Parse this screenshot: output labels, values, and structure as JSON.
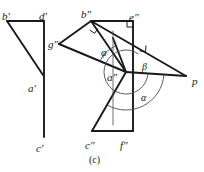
{
  "figure": {
    "caption": "(c)",
    "caption_pos": [
      89,
      155
    ],
    "width": 204,
    "height": 172,
    "stroke_color": "#1a1a1a",
    "thin_color": "#4a4a4a",
    "background": "#ffffff"
  },
  "labels": [
    {
      "id": "b-prime",
      "text": "b′",
      "x": 2,
      "y": 11,
      "kind": "point"
    },
    {
      "id": "d-prime",
      "text": "d′",
      "x": 39,
      "y": 11,
      "kind": "point"
    },
    {
      "id": "a-prime",
      "text": "a′",
      "x": 28,
      "y": 83,
      "kind": "point"
    },
    {
      "id": "c-prime",
      "text": "c′",
      "x": 36,
      "y": 143,
      "kind": "point"
    },
    {
      "id": "b-second",
      "text": "b″",
      "x": 81,
      "y": 9,
      "kind": "point"
    },
    {
      "id": "e-second",
      "text": "e″",
      "x": 129,
      "y": 12,
      "kind": "point"
    },
    {
      "id": "g-second",
      "text": "g″",
      "x": 48,
      "y": 39,
      "kind": "point"
    },
    {
      "id": "a-second",
      "text": "a″",
      "x": 107,
      "y": 72,
      "kind": "point"
    },
    {
      "id": "c-second",
      "text": "c″",
      "x": 85,
      "y": 140,
      "kind": "point"
    },
    {
      "id": "f-second",
      "text": "f″",
      "x": 120,
      "y": 140,
      "kind": "point"
    },
    {
      "id": "p-point",
      "text": "p",
      "x": 192,
      "y": 76,
      "kind": "point"
    },
    {
      "id": "phi",
      "text": "φ",
      "x": 101,
      "y": 48,
      "kind": "angle"
    },
    {
      "id": "beta",
      "text": "β",
      "x": 142,
      "y": 62,
      "kind": "angle"
    },
    {
      "id": "alpha",
      "text": "α",
      "x": 141,
      "y": 93,
      "kind": "angle"
    }
  ],
  "left_view": {
    "name": "front-projection",
    "polylines": [
      {
        "id": "b-d-top-edge",
        "points": "7,21 44,21"
      },
      {
        "id": "d-c-vertical",
        "points": "44,21 44,137"
      },
      {
        "id": "b-a-diagonal",
        "points": "7,21 43,75"
      }
    ]
  },
  "right_view": {
    "name": "side-projection",
    "polylines": [
      {
        "id": "b-e-top-edge",
        "points": "91,21 133,21"
      },
      {
        "id": "e-f-vertical",
        "points": "133,21 133,131"
      },
      {
        "id": "c-f-bottom-edge",
        "points": "92,131 133,131"
      },
      {
        "id": "b-g-upper",
        "points": "91,21 59,44"
      },
      {
        "id": "g-a-lower",
        "points": "59,44 126,72"
      },
      {
        "id": "b-a-inner",
        "points": "91,21 126,72"
      },
      {
        "id": "b-p-long",
        "points": "91,21 186,76"
      },
      {
        "id": "a-p-ray",
        "points": "126,72 186,76"
      },
      {
        "id": "a-c-lower-left",
        "points": "126,72 92,131"
      },
      {
        "id": "a-up-stub",
        "points": "126,72 113,38"
      },
      {
        "id": "a-vertical-thin",
        "points": "113,31 113,125",
        "thin": true
      }
    ],
    "right_angle_marks": [
      {
        "id": "right-angle-b",
        "cx": 93,
        "cy": 25,
        "a1": 34,
        "a2": 124,
        "size": 6
      },
      {
        "id": "right-angle-e",
        "cx": 133,
        "cy": 21,
        "a1": 180,
        "a2": 90,
        "size": 6
      },
      {
        "id": "right-angle-ap",
        "cx": 140,
        "cy": 45,
        "a1": 4,
        "a2": 94,
        "size": 6
      }
    ],
    "angle_arcs": [
      {
        "id": "phi-arc",
        "cx": 126,
        "cy": 72,
        "r": 28,
        "start": 203,
        "end": 247
      },
      {
        "id": "beta-arc",
        "cx": 126,
        "cy": 72,
        "r": 22,
        "start": 4,
        "end": 305
      },
      {
        "id": "alpha-arc",
        "cx": 126,
        "cy": 72,
        "r": 38,
        "start": 4,
        "end": 120
      }
    ]
  }
}
